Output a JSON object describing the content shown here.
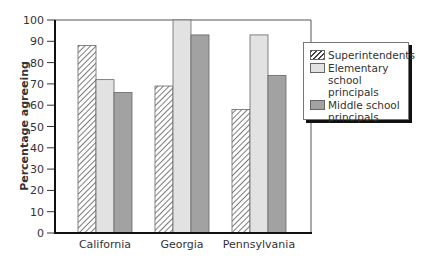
{
  "chart_data": {
    "type": "bar",
    "title": "",
    "xlabel": "",
    "ylabel": "Percentage agreeing",
    "ylim": [
      0,
      100
    ],
    "yticks": [
      0,
      10,
      20,
      30,
      40,
      50,
      60,
      70,
      80,
      90,
      100
    ],
    "grid": false,
    "legend_position": "right, overlapping plot frame",
    "categories": [
      "California",
      "Georgia",
      "Pennsylvania"
    ],
    "series": [
      {
        "name": "Superintendents",
        "pattern": "hatched",
        "color": "#444444",
        "values": [
          88,
          69,
          58
        ]
      },
      {
        "name": "Elementary school principals",
        "pattern": "solid",
        "color": "#e2e2e2",
        "values": [
          72,
          100,
          93
        ]
      },
      {
        "name": "Middle school principals",
        "pattern": "solid",
        "color": "#a2a2a2",
        "values": [
          66,
          93,
          74
        ]
      }
    ]
  },
  "legend": {
    "items": [
      {
        "label": "Superintendents"
      },
      {
        "label": "Elementary\nschool principals"
      },
      {
        "label": "Middle school\nprincipals"
      }
    ]
  }
}
